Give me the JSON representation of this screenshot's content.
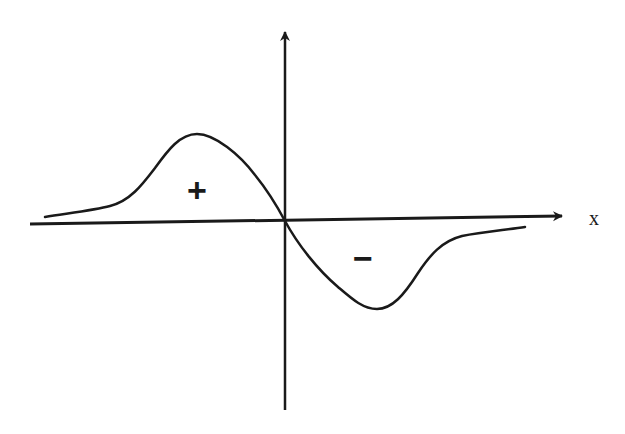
{
  "diagram": {
    "type": "function-sketch",
    "x_axis": {
      "label": "x",
      "has_arrow": true
    },
    "y_axis": {
      "label": "",
      "has_arrow": true
    },
    "regions": [
      {
        "name": "positive-lobe",
        "sign": "+"
      },
      {
        "name": "negative-lobe",
        "sign": "−"
      }
    ],
    "colors": {
      "stroke": "#1a1a1a",
      "background": "#ffffff"
    }
  }
}
